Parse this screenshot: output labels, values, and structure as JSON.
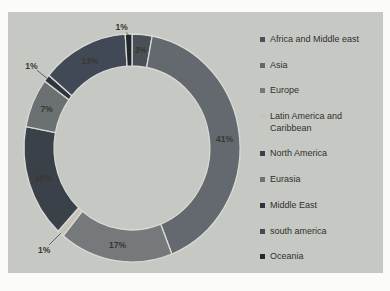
{
  "figure": {
    "background": "#fbfbfa",
    "panel_background": "#c6c8c3"
  },
  "chart_data": {
    "type": "pie",
    "subtype": "donut",
    "title": "",
    "legend_position": "right",
    "grid": false,
    "categories": [
      "Africa and Middle east",
      "Asia",
      "Europe",
      "Latin America and Caribbean",
      "North America",
      "Eurasia",
      "Middle East",
      "south america",
      "Oceania"
    ],
    "values": [
      3,
      41,
      17,
      1,
      16,
      7,
      1,
      13,
      1
    ],
    "data_labels": [
      "3%",
      "41%",
      "17%",
      "1%",
      "16%",
      "7%",
      "1%",
      "13%",
      "1%"
    ],
    "colors": [
      "#4a5058",
      "#63696e",
      "#75797c",
      "#c6c4b8",
      "#3a4148",
      "#6b7073",
      "#2e343c",
      "#414957",
      "#23282e"
    ],
    "separator_color": "#d9dad5",
    "leader_line_color": "#4a4a4a",
    "label_color": "#3a372f",
    "legend_text_color": "#30302e"
  }
}
